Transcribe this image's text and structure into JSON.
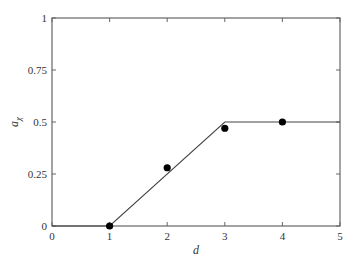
{
  "chart_data": {
    "type": "line",
    "title": "",
    "xlabel": "d",
    "ylabel": "a",
    "ylabel_subscript": "χ",
    "xlim": [
      0,
      5
    ],
    "ylim": [
      0,
      1
    ],
    "grid": false,
    "legend": null,
    "x_ticks": [
      0,
      1,
      2,
      3,
      4,
      5
    ],
    "x_tick_labels": [
      "0",
      "1",
      "2",
      "3",
      "4",
      "5"
    ],
    "y_ticks": [
      0,
      0.25,
      0.5,
      0.75,
      1
    ],
    "y_tick_labels": [
      "0",
      "0.25",
      "0.5",
      "0.75",
      "1"
    ],
    "series": [
      {
        "name": "model",
        "type": "line",
        "color": "#444444",
        "x": [
          0,
          1,
          3,
          5
        ],
        "y": [
          0,
          0,
          0.5,
          0.5
        ]
      },
      {
        "name": "observed",
        "type": "scatter",
        "color": "#000000",
        "x": [
          1,
          2,
          3,
          4
        ],
        "y": [
          0,
          0.28,
          0.47,
          0.5
        ]
      }
    ]
  },
  "layout": {
    "plot_left": 52,
    "plot_right": 340,
    "plot_top": 18,
    "plot_bottom": 226
  }
}
